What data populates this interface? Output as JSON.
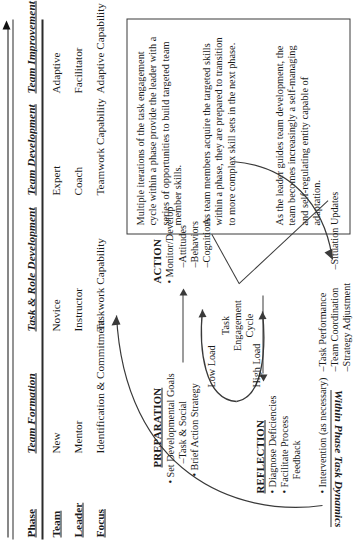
{
  "figure": {
    "orientation": "rotated-90",
    "progression_arrow": {
      "name": "developmental-progression-arrow",
      "direction": "left-to-right"
    },
    "banner_label": "Within Phase Task Dynamics"
  },
  "matrix": {
    "row_headers": [
      "Phase",
      "Team",
      "Leader",
      "Focus"
    ],
    "column_headers": [
      "Team Formation",
      "Task & Role Development",
      "Team Development",
      "Team Improvement"
    ],
    "rows": [
      {
        "label": "Team",
        "cells": [
          "New",
          "Novice",
          "Expert",
          "Adaptive"
        ]
      },
      {
        "label": "Leader",
        "cells": [
          "Mentor",
          "Instructor",
          "Coach",
          "Facilitator"
        ]
      },
      {
        "label": "Focus",
        "cells": [
          "Identification & Commitment",
          "Taskwork Capability",
          "Teamwork Capability",
          "Adaptive Capability"
        ]
      }
    ]
  },
  "callout": {
    "name": "explanatory-callout",
    "paragraphs": [
      "Multiple iterations of the task engagement cycle within a phase provide the leader with a series of opportunities to build targeted team member skills.",
      "As team members acquire the targeted skills within a phase, they are prepared to transition to more complex skill sets in the next phase.",
      "As the leader guides team development, the team becomes increasingly a self-managing and self-regulating entity capable of adaptation."
    ]
  },
  "cycle": {
    "center_label": "Task\nEngagement\nCycle",
    "center_lines": [
      "Task",
      "Engagement",
      "Cycle"
    ],
    "low_load": [
      "Low",
      "Load"
    ],
    "high_load": [
      "High",
      "Load"
    ]
  },
  "phases": {
    "preparation": {
      "title": "PREPARATION",
      "bullets": [
        "• Set Developmental Goals"
      ],
      "subitems": [
        "–Task & Social"
      ],
      "bullets2": [
        "• Brief Action Strategy"
      ]
    },
    "action": {
      "title": "ACTION",
      "bullets": [
        "• Monitor/Develop"
      ],
      "subitems": [
        "–Attitudes",
        "–Behaviors",
        "–Cognitions"
      ]
    },
    "reflection": {
      "title": "REFLECTION",
      "bullets": [
        "• Diagnose Deficiencies",
        "• Facilitate Process",
        "Feedback"
      ]
    },
    "intervention": {
      "bullets": [
        "• Intervention (as necessary)"
      ],
      "subitems": [
        "–Task Performance",
        "–Team Coordination",
        "–Strategy Adjustment",
        "–Situation Updates"
      ]
    }
  }
}
